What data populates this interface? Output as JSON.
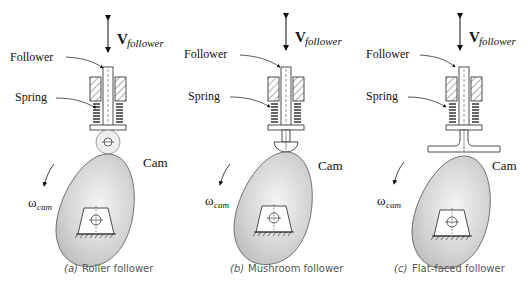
{
  "diagrams": [
    {
      "id": "a",
      "caption_letter": "(a)",
      "caption_text": "Roller follower",
      "labels": {
        "velocity_main": "V",
        "velocity_sub": "follower",
        "follower": "Follower",
        "spring": "Spring",
        "cam": "Cam",
        "omega_main": "ω",
        "omega_sub": "cam"
      },
      "follower_type": "roller"
    },
    {
      "id": "b",
      "caption_letter": "(b)",
      "caption_text": "Mushroom follower",
      "labels": {
        "velocity_main": "V",
        "velocity_sub": "follower",
        "follower": "Follower",
        "spring": "Spring",
        "cam": "Cam",
        "omega_main": "ω",
        "omega_sub": "cam"
      },
      "follower_type": "mushroom"
    },
    {
      "id": "c",
      "caption_letter": "(c)",
      "caption_text": "Flat-faced follower",
      "labels": {
        "velocity_main": "V",
        "velocity_sub": "follower",
        "follower": "Follower",
        "spring": "Spring",
        "cam": "Cam",
        "omega_main": "ω",
        "omega_sub": "cam"
      },
      "follower_type": "flat-faced"
    }
  ],
  "colors": {
    "cam_fill": "#c9c9c9",
    "cam_highlight": "#f2f2f2",
    "line": "#222222",
    "caption": "#555555"
  }
}
